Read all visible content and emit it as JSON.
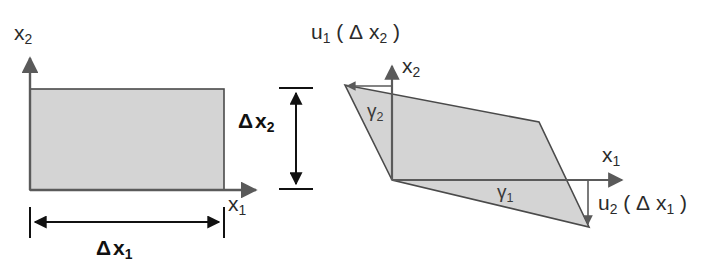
{
  "figure": {
    "background_color": "#ffffff",
    "shape_fill_color": "#d4d4d4",
    "shape_stroke_color": "#4a4a4a",
    "axis_color": "#5a5a5a",
    "dimension_color": "#111111",
    "text_color": "#2b2b2b"
  },
  "left_panel": {
    "name": "undeformed-element",
    "axes": {
      "x1_label": "x",
      "x1_subscript": "1",
      "x2_label": "x",
      "x2_subscript": "2"
    },
    "dimensions": [
      {
        "symbol": "Δ",
        "base": "x",
        "subscript": "2",
        "orientation": "vertical"
      },
      {
        "symbol": "Δ",
        "base": "x",
        "subscript": "1",
        "orientation": "horizontal"
      }
    ]
  },
  "right_panel": {
    "name": "deformed-element",
    "axes": {
      "x1_label": "x",
      "x1_subscript": "1",
      "x2_label": "x",
      "x2_subscript": "2"
    },
    "displacements": [
      {
        "base": "u",
        "subscript": "1",
        "argument_delta": "Δ",
        "argument_base": "x",
        "argument_subscript": "2",
        "direction": "left",
        "position": "top"
      },
      {
        "base": "u",
        "subscript": "2",
        "argument_delta": "Δ",
        "argument_base": "x",
        "argument_subscript": "1",
        "direction": "down",
        "position": "bottom-right"
      }
    ],
    "shear_angles": [
      {
        "symbol": "γ",
        "subscript": "1",
        "position": "bottom"
      },
      {
        "symbol": "γ",
        "subscript": "2",
        "position": "left"
      }
    ]
  }
}
